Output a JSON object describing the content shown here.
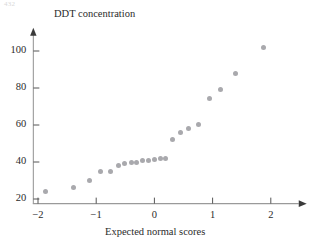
{
  "page": {
    "corner_text": "432"
  },
  "chart_data": {
    "type": "scatter",
    "title": "",
    "xlabel": "Expected normal scores",
    "ylabel": "DDT concentration",
    "xlim": [
      -2.35,
      2.6
    ],
    "ylim": [
      17,
      112
    ],
    "xticks": [
      -2,
      -1,
      0,
      1,
      2
    ],
    "xticklabels": [
      "−2",
      "−1",
      "0",
      "1",
      "2"
    ],
    "yticks": [
      20,
      40,
      60,
      80,
      100
    ],
    "yticklabels": [
      "20",
      "40",
      "60",
      "80",
      "100"
    ],
    "grid": false,
    "legend": null,
    "marker_color": "#a9a9ad",
    "axis_color": "#9a9a9a",
    "points": [
      {
        "x": -1.87,
        "y": 24
      },
      {
        "x": -1.39,
        "y": 26
      },
      {
        "x": -1.11,
        "y": 30
      },
      {
        "x": -0.92,
        "y": 35
      },
      {
        "x": -0.75,
        "y": 35
      },
      {
        "x": -0.62,
        "y": 38
      },
      {
        "x": -0.51,
        "y": 39
      },
      {
        "x": -0.4,
        "y": 39.5
      },
      {
        "x": -0.3,
        "y": 40
      },
      {
        "x": -0.2,
        "y": 41
      },
      {
        "x": -0.1,
        "y": 41
      },
      {
        "x": 0.0,
        "y": 41.5
      },
      {
        "x": 0.1,
        "y": 42
      },
      {
        "x": 0.19,
        "y": 42
      },
      {
        "x": 0.31,
        "y": 52
      },
      {
        "x": 0.45,
        "y": 56
      },
      {
        "x": 0.58,
        "y": 58
      },
      {
        "x": 0.75,
        "y": 60.5
      },
      {
        "x": 0.94,
        "y": 74.5
      },
      {
        "x": 1.13,
        "y": 79
      },
      {
        "x": 1.4,
        "y": 88
      },
      {
        "x": 1.87,
        "y": 102
      }
    ]
  }
}
